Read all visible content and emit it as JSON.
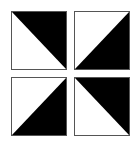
{
  "diagram": {
    "colors": {
      "fill": "#000000",
      "background": "#ffffff",
      "border": "#555555"
    },
    "tiles": [
      {
        "position": "top-left",
        "black_region": "top-right",
        "diagonal": "top-left to bottom-right"
      },
      {
        "position": "top-right",
        "black_region": "bottom-right",
        "diagonal": "bottom-left to top-right"
      },
      {
        "position": "bottom-left",
        "black_region": "bottom-right",
        "diagonal": "bottom-left to top-right"
      },
      {
        "position": "bottom-right",
        "black_region": "top-right",
        "diagonal": "top-left to bottom-right"
      }
    ]
  }
}
